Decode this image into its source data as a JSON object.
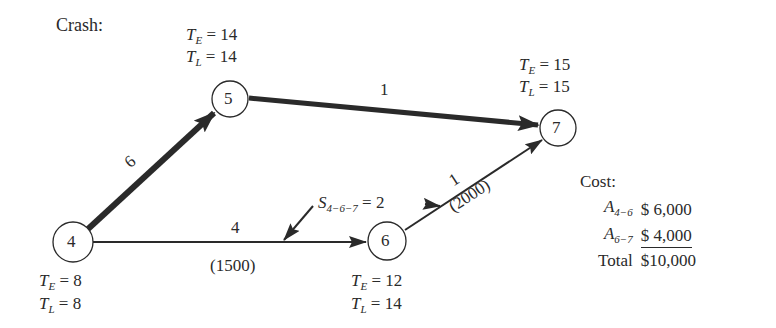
{
  "title": "Crash:",
  "nodes": [
    {
      "id": "4",
      "te_label": "T",
      "te_sub": "E",
      "te": "8",
      "tl_label": "T",
      "tl_sub": "L",
      "tl": "8"
    },
    {
      "id": "5",
      "te_label": "T",
      "te_sub": "E",
      "te": "14",
      "tl_label": "T",
      "tl_sub": "L",
      "tl": "14"
    },
    {
      "id": "6",
      "te_label": "T",
      "te_sub": "E",
      "te": "12",
      "tl_label": "T",
      "tl_sub": "L",
      "tl": "14"
    },
    {
      "id": "7",
      "te_label": "T",
      "te_sub": "E",
      "te": "15",
      "tl_label": "T",
      "tl_sub": "L",
      "tl": "15"
    }
  ],
  "edges": [
    {
      "from": "4",
      "to": "5",
      "duration": "6",
      "critical": true
    },
    {
      "from": "5",
      "to": "7",
      "duration": "1",
      "critical": true
    },
    {
      "from": "4",
      "to": "6",
      "duration": "4",
      "cost": "(1500)",
      "critical": false
    },
    {
      "from": "6",
      "to": "7",
      "duration": "1",
      "cost": "(2000)",
      "critical": false
    }
  ],
  "slack": {
    "label": "S",
    "sub": "4−6−7",
    "eq": "=",
    "value": "2"
  },
  "eq": "=",
  "cost": {
    "title": "Cost:",
    "rows": [
      {
        "label": "A",
        "sub": "4−6",
        "value": "$ 6,000"
      },
      {
        "label": "A",
        "sub": "6−7",
        "value": "$ 4,000"
      },
      {
        "label": "Total",
        "sub": "",
        "value": "$10,000"
      }
    ]
  },
  "colors": {
    "ink": "#2a2a2a",
    "background": "#ffffff"
  }
}
